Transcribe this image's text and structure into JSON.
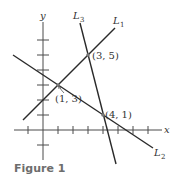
{
  "caption": "Figure 1",
  "axes": {
    "x_label": "x",
    "y_label": "y",
    "origin_px": [
      43,
      130
    ],
    "unit_px": 15,
    "x_ticks": [
      -1,
      1,
      2,
      3,
      4,
      5,
      6,
      7
    ],
    "y_ticks": [
      -1,
      1,
      2,
      3,
      4,
      5,
      6
    ]
  },
  "lines": [
    {
      "name": "L",
      "sub": "1",
      "through": [
        [
          1,
          3
        ],
        [
          3,
          5
        ]
      ]
    },
    {
      "name": "L",
      "sub": "2",
      "through": [
        [
          1,
          3
        ],
        [
          4,
          1
        ]
      ]
    },
    {
      "name": "L",
      "sub": "3",
      "through": [
        [
          3,
          5
        ],
        [
          4,
          1
        ]
      ]
    }
  ],
  "points": [
    {
      "label": "(1, 3)",
      "x": 1,
      "y": 3
    },
    {
      "label": "(3, 5)",
      "x": 3,
      "y": 5
    },
    {
      "label": "(4, 1)",
      "x": 4,
      "y": 1
    }
  ],
  "colors": {
    "line": "#2a2a2a",
    "axis": "#4a4a4a",
    "caption": "#6d6d6d"
  }
}
